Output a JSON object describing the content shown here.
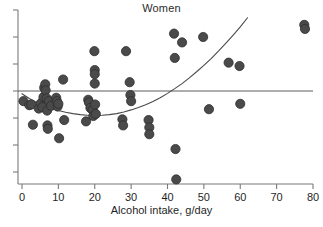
{
  "chart_data": {
    "type": "scatter",
    "title": "Women",
    "xlabel": "Alcohol intake, g/day",
    "ylabel": "",
    "xlim": [
      0,
      80
    ],
    "ylim": [
      -3.2,
      3.4
    ],
    "grid": false,
    "legend": null,
    "xticks": [
      0,
      10,
      20,
      30,
      40,
      50,
      60,
      70,
      80
    ],
    "xticklabels": [
      "0",
      "10",
      "20",
      "30",
      "40",
      "50",
      "60",
      "70",
      "80"
    ],
    "yticks": [
      -2.4,
      -1.6,
      -0.8,
      0,
      0.8,
      1.6,
      2.4
    ],
    "yticklabels": [
      "",
      "",
      "",
      "",
      "",
      "",
      ""
    ],
    "reference_line": {
      "type": "horizontal",
      "y": 0,
      "color": "#4a4a4a"
    },
    "marker": {
      "shape": "circle",
      "color": "#4a4a4a",
      "edge_color": "#2f2f2f",
      "size": 4.6
    },
    "series": [
      {
        "name": "Women",
        "points": [
          [
            0.4,
            -0.3
          ],
          [
            2.0,
            -0.42
          ],
          [
            2.6,
            -0.4
          ],
          [
            3.0,
            -1.0
          ],
          [
            4.6,
            -0.52
          ],
          [
            5.2,
            -0.36
          ],
          [
            5.6,
            -0.48
          ],
          [
            5.9,
            -0.18
          ],
          [
            6.1,
            0.1
          ],
          [
            6.4,
            0.2
          ],
          [
            6.5,
            0.02
          ],
          [
            6.8,
            -0.22
          ],
          [
            6.9,
            -0.58
          ],
          [
            7.0,
            -1.02
          ],
          [
            7.1,
            -1.12
          ],
          [
            7.4,
            -0.3
          ],
          [
            8.0,
            -0.44
          ],
          [
            9.4,
            -0.2
          ],
          [
            9.6,
            -0.3
          ],
          [
            9.8,
            -0.46
          ],
          [
            10.0,
            -0.38
          ],
          [
            10.2,
            -1.4
          ],
          [
            11.3,
            0.34
          ],
          [
            11.6,
            -0.86
          ],
          [
            17.6,
            -0.9
          ],
          [
            18.2,
            -0.26
          ],
          [
            18.4,
            -0.34
          ],
          [
            18.8,
            -0.5
          ],
          [
            19.4,
            -0.56
          ],
          [
            19.6,
            -0.74
          ],
          [
            19.9,
            1.18
          ],
          [
            20.0,
            0.62
          ],
          [
            20.0,
            0.5
          ],
          [
            20.0,
            0.22
          ],
          [
            20.1,
            -0.4
          ],
          [
            20.3,
            -0.68
          ],
          [
            27.6,
            -0.84
          ],
          [
            27.8,
            -1.02
          ],
          [
            28.6,
            1.18
          ],
          [
            29.6,
            0.26
          ],
          [
            29.8,
            -0.12
          ],
          [
            30.0,
            -0.3
          ],
          [
            34.8,
            -0.86
          ],
          [
            35.0,
            -1.08
          ],
          [
            35.0,
            -1.28
          ],
          [
            41.8,
            1.7
          ],
          [
            42.0,
            0.98
          ],
          [
            42.2,
            -1.72
          ],
          [
            42.4,
            -2.62
          ],
          [
            44.0,
            1.44
          ],
          [
            49.8,
            1.6
          ],
          [
            51.4,
            -0.54
          ],
          [
            56.8,
            0.84
          ],
          [
            59.8,
            0.74
          ],
          [
            60.0,
            -0.38
          ],
          [
            77.6,
            1.96
          ],
          [
            77.8,
            1.84
          ]
        ]
      }
    ],
    "fit_curve": {
      "name": "quadratic-fit",
      "color": "#4a4a4a",
      "width": 1.1,
      "points": [
        [
          0.0,
          -0.08
        ],
        [
          2.0,
          -0.22
        ],
        [
          4.0,
          -0.34
        ],
        [
          6.0,
          -0.44
        ],
        [
          8.0,
          -0.52
        ],
        [
          10.0,
          -0.58
        ],
        [
          12.0,
          -0.63
        ],
        [
          14.0,
          -0.67
        ],
        [
          16.0,
          -0.7
        ],
        [
          18.0,
          -0.72
        ],
        [
          20.0,
          -0.73
        ],
        [
          22.0,
          -0.72
        ],
        [
          24.0,
          -0.7
        ],
        [
          26.0,
          -0.67
        ],
        [
          28.0,
          -0.62
        ],
        [
          30.0,
          -0.56
        ],
        [
          32.0,
          -0.49
        ],
        [
          34.0,
          -0.41
        ],
        [
          36.0,
          -0.31
        ],
        [
          38.0,
          -0.2
        ],
        [
          40.0,
          -0.07
        ],
        [
          42.0,
          0.07
        ],
        [
          44.0,
          0.22
        ],
        [
          46.0,
          0.39
        ],
        [
          48.0,
          0.57
        ],
        [
          50.0,
          0.76
        ],
        [
          52.0,
          0.96
        ],
        [
          54.0,
          1.18
        ],
        [
          56.0,
          1.41
        ],
        [
          58.0,
          1.65
        ],
        [
          60.0,
          1.9
        ],
        [
          62.0,
          2.17
        ],
        [
          64.0,
          2.45
        ],
        [
          66.0,
          2.74
        ],
        [
          68.0,
          3.04
        ],
        [
          70.0,
          3.36
        ],
        [
          71.0,
          3.52
        ],
        [
          72.0,
          3.68
        ],
        [
          73.0,
          3.85
        ],
        [
          74.0,
          4.02
        ]
      ]
    }
  }
}
